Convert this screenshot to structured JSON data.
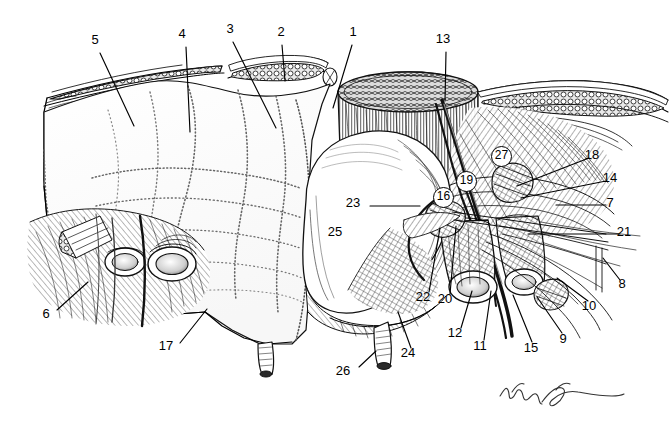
{
  "figure": {
    "type": "anatomical-dissection-illustration",
    "style": "black-and-white pen-and-ink line drawing",
    "background_color": "#ffffff",
    "ink_color": "#000000",
    "signature": "handwritten artist signature, cursive, bottom right"
  },
  "labels": [
    {
      "id": "1",
      "text": "1",
      "x": 353,
      "y": 31,
      "circled": false,
      "leader": {
        "x1": 352,
        "y1": 45,
        "x2": 333,
        "y2": 108
      }
    },
    {
      "id": "2",
      "text": "2",
      "x": 281,
      "y": 31,
      "circled": false,
      "leader": {
        "x1": 282,
        "y1": 45,
        "x2": 285,
        "y2": 81
      }
    },
    {
      "id": "3",
      "text": "3",
      "x": 230,
      "y": 28,
      "circled": false,
      "leader": {
        "x1": 233,
        "y1": 42,
        "x2": 276,
        "y2": 128
      }
    },
    {
      "id": "4",
      "text": "4",
      "x": 182,
      "y": 33,
      "circled": false,
      "leader": {
        "x1": 186,
        "y1": 47,
        "x2": 190,
        "y2": 132
      }
    },
    {
      "id": "5",
      "text": "5",
      "x": 95,
      "y": 39,
      "circled": false,
      "leader": {
        "x1": 100,
        "y1": 53,
        "x2": 134,
        "y2": 126
      }
    },
    {
      "id": "6",
      "text": "6",
      "x": 46,
      "y": 313,
      "circled": false,
      "leader": {
        "x1": 57,
        "y1": 310,
        "x2": 88,
        "y2": 282
      }
    },
    {
      "id": "7",
      "text": "7",
      "x": 610,
      "y": 202,
      "circled": false,
      "leader": {
        "x1": 606,
        "y1": 205,
        "x2": 556,
        "y2": 205
      }
    },
    {
      "id": "8",
      "text": "8",
      "x": 622,
      "y": 283,
      "circled": false,
      "leader": {
        "x1": 620,
        "y1": 280,
        "x2": 603,
        "y2": 258
      }
    },
    {
      "id": "9",
      "text": "9",
      "x": 563,
      "y": 338,
      "circled": false,
      "leader": {
        "x1": 562,
        "y1": 333,
        "x2": 537,
        "y2": 297
      }
    },
    {
      "id": "10",
      "text": "10",
      "x": 589,
      "y": 305,
      "circled": false,
      "leader": {
        "x1": 588,
        "y1": 301,
        "x2": 557,
        "y2": 278
      }
    },
    {
      "id": "11",
      "text": "11",
      "x": 480,
      "y": 345,
      "circled": false,
      "leader": {
        "x1": 484,
        "y1": 340,
        "x2": 491,
        "y2": 291
      }
    },
    {
      "id": "12",
      "text": "12",
      "x": 455,
      "y": 332,
      "circled": false,
      "leader": {
        "x1": 461,
        "y1": 328,
        "x2": 472,
        "y2": 291
      }
    },
    {
      "id": "13",
      "text": "13",
      "x": 443,
      "y": 38,
      "circled": false,
      "leader": {
        "x1": 446,
        "y1": 52,
        "x2": 445,
        "y2": 101
      }
    },
    {
      "id": "14",
      "text": "14",
      "x": 610,
      "y": 177,
      "circled": false,
      "leader": {
        "x1": 606,
        "y1": 181,
        "x2": 521,
        "y2": 198
      }
    },
    {
      "id": "15",
      "text": "15",
      "x": 531,
      "y": 347,
      "circled": false,
      "leader": {
        "x1": 532,
        "y1": 342,
        "x2": 513,
        "y2": 295
      }
    },
    {
      "id": "16",
      "text": "16",
      "x": 442,
      "y": 196,
      "circled": true,
      "leader": null
    },
    {
      "id": "17",
      "text": "17",
      "x": 166,
      "y": 345,
      "circled": false,
      "leader": {
        "x1": 180,
        "y1": 343,
        "x2": 207,
        "y2": 309
      }
    },
    {
      "id": "18",
      "text": "18",
      "x": 592,
      "y": 154,
      "circled": false,
      "leader": {
        "x1": 589,
        "y1": 158,
        "x2": 517,
        "y2": 186
      }
    },
    {
      "id": "19",
      "text": "19",
      "x": 465,
      "y": 180,
      "circled": true,
      "leader": null
    },
    {
      "id": "20",
      "text": "20",
      "x": 445,
      "y": 298,
      "circled": false,
      "leader": {
        "x1": 450,
        "y1": 294,
        "x2": 456,
        "y2": 226
      }
    },
    {
      "id": "21",
      "text": "21",
      "x": 624,
      "y": 231,
      "circled": false,
      "leader": {
        "x1": 620,
        "y1": 234,
        "x2": 528,
        "y2": 234
      }
    },
    {
      "id": "22",
      "text": "22",
      "x": 423,
      "y": 296,
      "circled": false,
      "leader": {
        "x1": 429,
        "y1": 292,
        "x2": 440,
        "y2": 228
      }
    },
    {
      "id": "23",
      "text": "23",
      "x": 353,
      "y": 202,
      "circled": false,
      "leader": {
        "x1": 370,
        "y1": 206,
        "x2": 420,
        "y2": 206
      }
    },
    {
      "id": "24",
      "text": "24",
      "x": 408,
      "y": 352,
      "circled": false,
      "leader": {
        "x1": 411,
        "y1": 348,
        "x2": 398,
        "y2": 312
      }
    },
    {
      "id": "25",
      "text": "25",
      "x": 335,
      "y": 231,
      "circled": false,
      "leader": null
    },
    {
      "id": "26",
      "text": "26",
      "x": 343,
      "y": 370,
      "circled": false,
      "leader": {
        "x1": 359,
        "y1": 367,
        "x2": 376,
        "y2": 351
      }
    },
    {
      "id": "27",
      "text": "27",
      "x": 500,
      "y": 155,
      "circled": true,
      "leader": null
    }
  ]
}
